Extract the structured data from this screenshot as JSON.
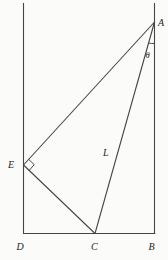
{
  "diagram": {
    "background_color": "#fbfbf9",
    "stroke_color": "#454545",
    "label_color": "#1e1e1e",
    "point_labels": {
      "A": "A",
      "B": "B",
      "C": "C",
      "D": "D",
      "E": "E"
    },
    "segment_label_L": "L",
    "angle_label_theta": "θ",
    "annotations": {
      "right_angle_marker_at": "E",
      "angle_arc_at": "A"
    }
  }
}
